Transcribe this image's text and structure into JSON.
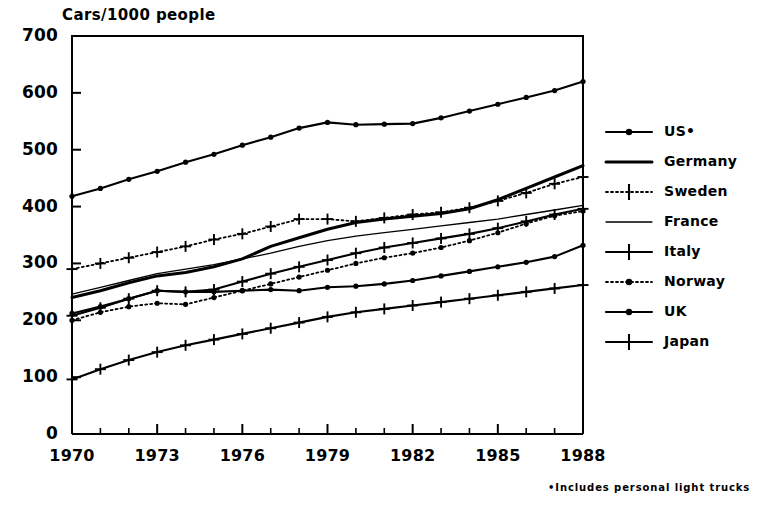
{
  "chart_data": {
    "type": "line",
    "title": "Cars/1000 people",
    "xlabel": "",
    "ylabel": "Cars/1000 people",
    "xlim": [
      1970,
      1988
    ],
    "ylim": [
      0,
      700
    ],
    "ytick_values": [
      0,
      100,
      200,
      300,
      400,
      500,
      600,
      700
    ],
    "ytick_labels": [
      "0",
      "100",
      "200",
      "300",
      "400",
      "500",
      "600",
      "700"
    ],
    "xtick_values": [
      1970,
      1973,
      1976,
      1979,
      1982,
      1985,
      1988
    ],
    "xtick_labels": [
      "1970",
      "1973",
      "1976",
      "1979",
      "1982",
      "1985",
      "1988"
    ],
    "x_minor_ticks": [
      1971,
      1972,
      1974,
      1975,
      1977,
      1978,
      1980,
      1981,
      1983,
      1984,
      1986,
      1987
    ],
    "grid": false,
    "legend_position": "right",
    "annotation": "•Includes personal light trucks",
    "x": [
      1970,
      1971,
      1972,
      1973,
      1974,
      1975,
      1976,
      1977,
      1978,
      1979,
      1980,
      1981,
      1982,
      1983,
      1984,
      1985,
      1986,
      1987,
      1988
    ],
    "series": [
      {
        "name": "US•",
        "label": "US•",
        "line_style": "solid",
        "marker": "dot",
        "values": [
          418,
          432,
          448,
          462,
          478,
          492,
          508,
          522,
          538,
          548,
          544,
          545,
          546,
          556,
          568,
          580,
          592,
          604,
          620
        ]
      },
      {
        "name": "Germany",
        "label": "Germany",
        "line_style": "solid-thick",
        "marker": "none",
        "values": [
          240,
          252,
          266,
          278,
          284,
          294,
          308,
          330,
          345,
          360,
          372,
          378,
          383,
          388,
          396,
          412,
          432,
          452,
          472
        ]
      },
      {
        "name": "Sweden",
        "label": "Sweden",
        "line_style": "dotted",
        "marker": "plus",
        "values": [
          290,
          300,
          310,
          320,
          330,
          342,
          352,
          365,
          378,
          378,
          374,
          380,
          386,
          390,
          398,
          410,
          424,
          440,
          452
        ]
      },
      {
        "name": "France",
        "label": "France",
        "line_style": "solid-thin",
        "marker": "none",
        "values": [
          246,
          258,
          270,
          282,
          290,
          298,
          308,
          318,
          330,
          340,
          348,
          354,
          360,
          366,
          372,
          378,
          386,
          394,
          402
        ]
      },
      {
        "name": "Italy",
        "label": "Italy",
        "line_style": "solid",
        "marker": "plus",
        "values": [
          208,
          222,
          238,
          252,
          250,
          254,
          268,
          282,
          294,
          306,
          318,
          328,
          336,
          344,
          352,
          362,
          374,
          386,
          396
        ]
      },
      {
        "name": "Norway",
        "label": "Norway",
        "line_style": "dotted",
        "marker": "dot",
        "values": [
          200,
          214,
          224,
          230,
          228,
          240,
          252,
          264,
          276,
          288,
          300,
          310,
          318,
          328,
          340,
          354,
          370,
          384,
          392
        ]
      },
      {
        "name": "UK",
        "label": "UK",
        "line_style": "solid",
        "marker": "dot",
        "values": [
          212,
          224,
          238,
          252,
          250,
          250,
          252,
          254,
          252,
          258,
          260,
          264,
          270,
          278,
          286,
          294,
          302,
          312,
          332
        ]
      },
      {
        "name": "Japan",
        "label": "Japan",
        "line_style": "solid",
        "marker": "plus",
        "values": [
          96,
          114,
          130,
          144,
          156,
          166,
          176,
          186,
          196,
          206,
          214,
          220,
          226,
          232,
          238,
          244,
          250,
          256,
          262
        ]
      }
    ]
  },
  "footnote": {
    "text": "•Includes personal light trucks"
  }
}
